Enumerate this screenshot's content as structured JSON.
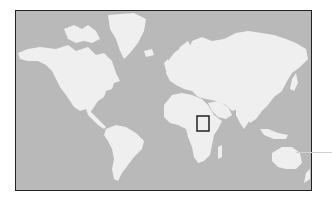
{
  "map": {
    "projection": "mercator",
    "style": "grayscale",
    "colors": {
      "ocean": "#b9b9b9",
      "land": "#efefef",
      "frame": "#222222",
      "highlight": "#222222",
      "leader": "#d0d0d0"
    },
    "highlight_region": {
      "label": "",
      "region": "Horn of Africa / Somalia",
      "box_px": {
        "x": 196,
        "y": 115,
        "w": 12,
        "h": 15
      }
    },
    "continents": [
      "North America",
      "South America",
      "Greenland",
      "Europe",
      "Asia",
      "Africa",
      "Australia",
      "Madagascar",
      "New Zealand"
    ]
  }
}
